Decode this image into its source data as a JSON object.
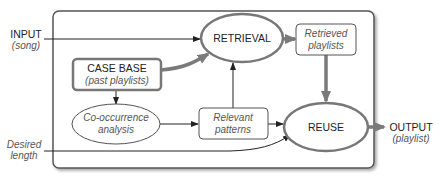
{
  "diagram": {
    "type": "flowchart",
    "colors": {
      "thick_edge": "#7a7a7a",
      "thin_edge": "#222222",
      "node_border_thick": "#777777",
      "node_border_thin": "#555555"
    },
    "external": {
      "input": {
        "title": "INPUT",
        "subtitle": "(song)"
      },
      "desired_length": {
        "line1": "Desired",
        "line2": "length"
      },
      "output": {
        "title": "OUTPUT",
        "subtitle": "(playlist)"
      }
    },
    "nodes": {
      "retrieval": {
        "label": "RETRIEVAL",
        "shape": "ellipse"
      },
      "retrieved_playlists": {
        "line1": "Retrieved",
        "line2": "playlists",
        "shape": "rounded-rect"
      },
      "case_base": {
        "title": "CASE BASE",
        "subtitle": "(past playlists)",
        "shape": "rounded-rect"
      },
      "cooccurrence": {
        "line1": "Co-occurrence",
        "line2": "analysis",
        "shape": "ellipse"
      },
      "relevant_patterns": {
        "line1": "Relevant",
        "line2": "patterns",
        "shape": "rounded-rect"
      },
      "reuse": {
        "label": "REUSE",
        "shape": "ellipse"
      }
    },
    "edges": [
      {
        "from": "input",
        "to": "retrieval",
        "style": "thin"
      },
      {
        "from": "case_base",
        "to": "retrieval",
        "style": "thick"
      },
      {
        "from": "retrieval",
        "to": "retrieved_playlists",
        "style": "thick"
      },
      {
        "from": "case_base",
        "to": "cooccurrence",
        "style": "thin"
      },
      {
        "from": "cooccurrence",
        "to": "relevant_patterns",
        "style": "thin"
      },
      {
        "from": "relevant_patterns",
        "to": "retrieval",
        "style": "thin"
      },
      {
        "from": "relevant_patterns",
        "to": "reuse",
        "style": "thin"
      },
      {
        "from": "retrieved_playlists",
        "to": "reuse",
        "style": "thick"
      },
      {
        "from": "desired_length",
        "to": "reuse",
        "style": "thin"
      },
      {
        "from": "reuse",
        "to": "output",
        "style": "thick"
      }
    ]
  }
}
